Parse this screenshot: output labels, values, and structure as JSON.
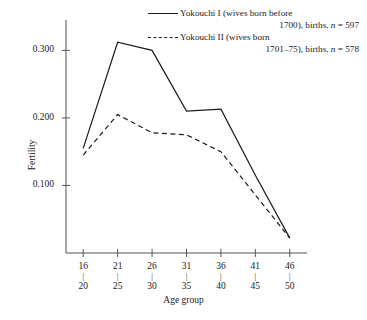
{
  "chart_data": {
    "type": "line",
    "title": "",
    "xlabel": "Age group",
    "ylabel": "Fertility",
    "categories": [
      "16–20",
      "21–25",
      "26–30",
      "31–35",
      "36–40",
      "41–45",
      "46–50"
    ],
    "x_tick_top": [
      "16",
      "21",
      "26",
      "31",
      "36",
      "41",
      "46"
    ],
    "x_tick_bottom": [
      "20",
      "25",
      "30",
      "35",
      "40",
      "45",
      "50"
    ],
    "x_tick_separator": "|",
    "y_ticks": [
      "0.300",
      "0.200",
      "0.100"
    ],
    "y_tick_values": [
      0.3,
      0.2,
      0.1
    ],
    "ylim": [
      0.0,
      0.345
    ],
    "grid": false,
    "legend_position": "top-right",
    "series": [
      {
        "name": "Yokouchi I",
        "style": "solid",
        "values": [
          0.155,
          0.312,
          0.3,
          0.21,
          0.213,
          0.115,
          0.022
        ]
      },
      {
        "name": "Yokouchi II",
        "style": "dashed",
        "values": [
          0.145,
          0.205,
          0.178,
          0.175,
          0.15,
          0.086,
          0.022
        ]
      }
    ]
  },
  "legend": {
    "entries": [
      {
        "line1": "Yokouchi I (wives born before",
        "line2_prefix": "1700), births, ",
        "line2_n": "n",
        "line2_value": " = 597",
        "style": "solid"
      },
      {
        "line1": "Yokouchi II (wives born",
        "line2_prefix": "1701–75), births, ",
        "line2_n": "n",
        "line2_value": " = 578",
        "style": "dashed"
      }
    ]
  },
  "axes": {
    "y_axis_label": "Fertility",
    "x_axis_label": "Age group"
  },
  "colors": {
    "line": "#1a1a1a",
    "axis": "#555555",
    "background": "#ffffff"
  }
}
